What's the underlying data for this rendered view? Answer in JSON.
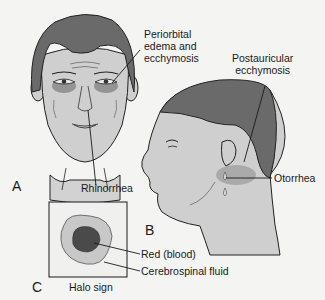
{
  "figure": {
    "panels": [
      {
        "id": "A",
        "letter": "A",
        "subject": "frontal-face"
      },
      {
        "id": "B",
        "letter": "B",
        "subject": "profile-head"
      },
      {
        "id": "C",
        "letter": "C",
        "subject": "halo-sign"
      }
    ],
    "labels": {
      "periorbital_line1": "Periorbital",
      "periorbital_line2": "edema and",
      "periorbital_line3": "ecchymosis",
      "postauricular_line1": "Postauricular",
      "postauricular_line2": "ecchymosis",
      "rhinorrhea": "Rhinorrhea",
      "otorrhea": "Otorrhea",
      "red_blood": "Red (blood)",
      "csf": "Cerebrospinal fluid",
      "halo_sign": "Halo sign"
    },
    "colors": {
      "background": "#f4f4f2",
      "hair": "#6a6a6a",
      "skin": "#cfcfcf",
      "bruise": "#8a8a8a",
      "blood": "#4a4a4a",
      "csf": "#c8c8c8",
      "line": "#1a1a1a"
    }
  }
}
